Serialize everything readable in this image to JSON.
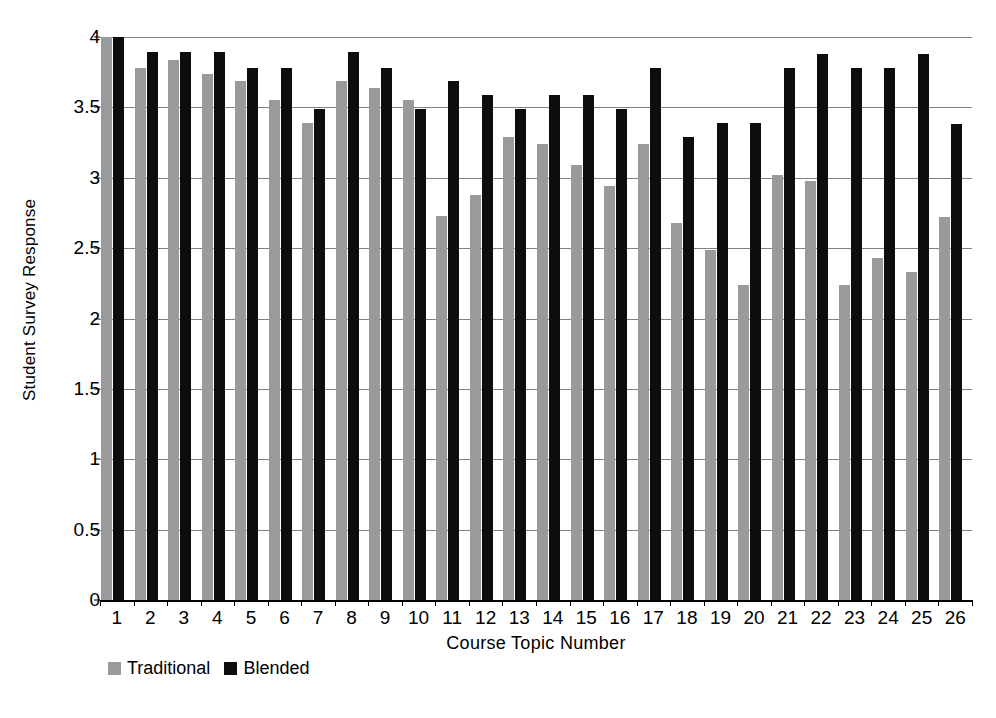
{
  "chart_data": {
    "type": "bar",
    "title": "",
    "subtitle": "",
    "xlabel": "Course Topic Number",
    "ylabel": "Student Survey Response",
    "ylim": [
      0,
      4
    ],
    "ytick_step": 0.5,
    "yticks": [
      "0",
      "0.5",
      "1",
      "1.5",
      "2",
      "2.5",
      "3",
      "3.5",
      "4"
    ],
    "ytick_values": [
      0,
      0.5,
      1,
      1.5,
      2,
      2.5,
      3,
      3.5,
      4
    ],
    "grid": true,
    "grid_axis": "y",
    "legend_position": "bottom-left",
    "categories": [
      "1",
      "2",
      "3",
      "4",
      "5",
      "6",
      "7",
      "8",
      "9",
      "10",
      "11",
      "12",
      "13",
      "14",
      "15",
      "16",
      "17",
      "18",
      "19",
      "20",
      "21",
      "22",
      "23",
      "24",
      "25",
      "26"
    ],
    "series": [
      {
        "name": "Traditional",
        "color": "#9a9a9a",
        "values": [
          4.0,
          3.78,
          3.84,
          3.74,
          3.69,
          3.55,
          3.39,
          3.69,
          3.64,
          3.55,
          2.73,
          2.88,
          3.29,
          3.24,
          3.09,
          2.94,
          3.24,
          2.68,
          2.49,
          2.24,
          3.02,
          2.98,
          2.24,
          2.43,
          2.33,
          2.72
        ]
      },
      {
        "name": "Blended",
        "color": "#0d0d0d",
        "values": [
          4.0,
          3.89,
          3.89,
          3.89,
          3.78,
          3.78,
          3.49,
          3.89,
          3.78,
          3.49,
          3.69,
          3.59,
          3.49,
          3.59,
          3.59,
          3.49,
          3.78,
          3.29,
          3.39,
          3.39,
          3.78,
          3.88,
          3.78,
          3.78,
          3.88,
          3.38
        ]
      }
    ]
  },
  "legend": {
    "items": [
      {
        "label": "Traditional",
        "color": "#9a9a9a"
      },
      {
        "label": "Blended",
        "color": "#0d0d0d"
      }
    ]
  },
  "colors": {
    "traditional": "#9a9a9a",
    "blended": "#0d0d0d",
    "gridline": "#808080",
    "axis": "#000000",
    "background": "#ffffff"
  }
}
